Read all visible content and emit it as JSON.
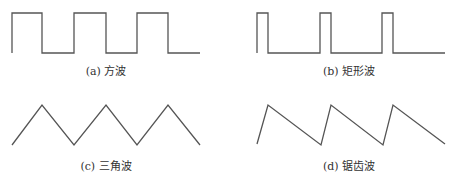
{
  "figure": {
    "panels": [
      {
        "id": "a",
        "caption": "(a) 方波",
        "type": "square-wave",
        "points": "12,53 12,13 42,13 42,53 74,53 74,13 106,13 106,53 137,53 137,13 168,13 168,53 200,53"
      },
      {
        "id": "b",
        "caption": "(b) 矩形波",
        "type": "rectangular-wave",
        "points": "257,53 257,13 268,13 268,53 320,53 320,13 331,13 331,53 382,53 382,13 393,13 393,53 445,53"
      },
      {
        "id": "c",
        "caption": "(c) 三角波",
        "type": "triangle-wave",
        "points": "12,145 42,105 74,145 106,105 137,145 168,105 200,145"
      },
      {
        "id": "d",
        "caption": "(d) 锯齿波",
        "type": "sawtooth-wave",
        "points": "257,144 268,105 321,145 331,105 383,145 393,105 445,144"
      }
    ],
    "stroke_color": "#555555",
    "text_color": "#333333"
  }
}
